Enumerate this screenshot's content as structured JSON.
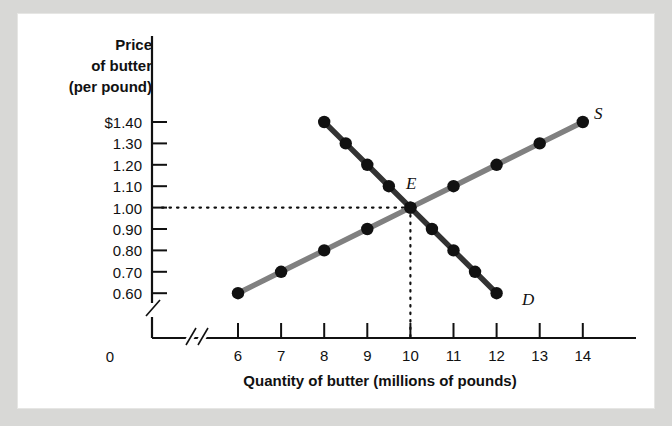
{
  "figure": {
    "background_color": "#d8d8d6",
    "panel_color": "#ffffff"
  },
  "axes": {
    "y_title_lines": [
      "Price",
      "of butter",
      "(per pound)"
    ],
    "y_tick_labels": [
      "$1.40",
      "1.30",
      "1.20",
      "1.10",
      "1.00",
      "0.90",
      "0.80",
      "0.70",
      "0.60"
    ],
    "x_tick_labels": [
      "6",
      "7",
      "8",
      "9",
      "10",
      "11",
      "12",
      "13",
      "14"
    ],
    "x_title": "Quantity of butter (millions of pounds)",
    "origin_label": "0",
    "axis_break_symbol": "//"
  },
  "annotations": {
    "equilibrium_label": "E",
    "supply_label": "S",
    "demand_label": "D"
  },
  "chart_data": {
    "type": "line",
    "title": "",
    "xlabel": "Quantity of butter (millions of pounds)",
    "ylabel": "Price of butter (per pound)",
    "xlim": [
      6,
      14
    ],
    "ylim": [
      0.6,
      1.4
    ],
    "grid": false,
    "legend": "inline-curve-labels",
    "x_tick_values": [
      6,
      7,
      8,
      9,
      10,
      11,
      12,
      13,
      14
    ],
    "y_tick_values": [
      1.4,
      1.3,
      1.2,
      1.1,
      1.0,
      0.9,
      0.8,
      0.7,
      0.6
    ],
    "series": [
      {
        "name": "S",
        "role": "supply",
        "color": "#808080",
        "marker_color": "#111111",
        "points": [
          {
            "x": 6,
            "y": 0.6
          },
          {
            "x": 7,
            "y": 0.7
          },
          {
            "x": 8,
            "y": 0.8
          },
          {
            "x": 9,
            "y": 0.9
          },
          {
            "x": 10,
            "y": 1.0
          },
          {
            "x": 11,
            "y": 1.1
          },
          {
            "x": 12,
            "y": 1.2
          },
          {
            "x": 13,
            "y": 1.3
          },
          {
            "x": 14,
            "y": 1.4
          }
        ]
      },
      {
        "name": "D",
        "role": "demand",
        "color": "#333333",
        "marker_color": "#111111",
        "points": [
          {
            "x": 8,
            "y": 1.4
          },
          {
            "x": 8.5,
            "y": 1.3
          },
          {
            "x": 9,
            "y": 1.2
          },
          {
            "x": 9.5,
            "y": 1.1
          },
          {
            "x": 10,
            "y": 1.0
          },
          {
            "x": 10.5,
            "y": 0.9
          },
          {
            "x": 11,
            "y": 0.8
          },
          {
            "x": 11.5,
            "y": 0.7
          },
          {
            "x": 12,
            "y": 0.6
          }
        ]
      }
    ],
    "equilibrium": {
      "label": "E",
      "x": 10,
      "y": 1.0
    },
    "guide_lines": [
      {
        "type": "horizontal",
        "value": 1.0,
        "style": "dotted",
        "from_x": 6.0,
        "to_x": 10
      },
      {
        "type": "vertical",
        "value": 10,
        "style": "dotted",
        "from_y": 0.5,
        "to_y": 1.0
      }
    ]
  }
}
